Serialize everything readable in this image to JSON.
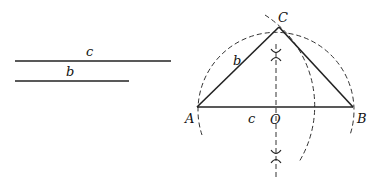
{
  "figure": {
    "given_segments": [
      {
        "name": "c",
        "label": "c"
      },
      {
        "name": "b",
        "label": "b"
      }
    ],
    "points": {
      "A": "A",
      "B": "B",
      "C": "C",
      "O": "O"
    },
    "side_labels": {
      "AC": "b",
      "AB": "c"
    }
  }
}
